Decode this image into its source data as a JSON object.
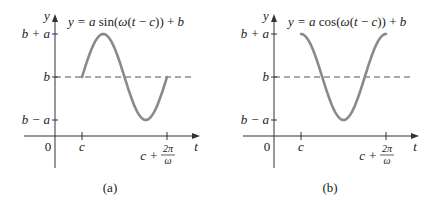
{
  "chart_data": [
    {
      "type": "line",
      "panel_label": "(a)",
      "function": "sin",
      "title": "y = a sin(ω(t − c)) + b",
      "title_parts": [
        "y = ",
        "a",
        " sin(",
        "ω",
        "(",
        "t",
        " − ",
        "c",
        ")) + ",
        "b"
      ],
      "xlabel": "t",
      "ylabel": "y",
      "origin_label": "0",
      "x_ticks": [
        {
          "label": "c",
          "value": 0
        },
        {
          "label_main": "c + ",
          "label_num": "2π",
          "label_den": "ω",
          "value": 1
        }
      ],
      "y_ticks": [
        {
          "label": "b + a",
          "value": 1
        },
        {
          "label": "b",
          "value": 0
        },
        {
          "label": "b − a",
          "value": -1
        }
      ],
      "dashed_line": {
        "y": 0,
        "label": "b"
      },
      "x_range_periods": [
        0,
        1
      ],
      "series": [
        {
          "name": "y",
          "amplitude": 1,
          "midline": 0,
          "periods": 1
        }
      ],
      "colors": {
        "curve": "#8a8a8a",
        "axis": "#333333"
      }
    },
    {
      "type": "line",
      "panel_label": "(b)",
      "function": "cos",
      "title": "y = a cos(ω(t − c)) + b",
      "title_parts": [
        "y = ",
        "a",
        " cos(",
        "ω",
        "(",
        "t",
        " − ",
        "c",
        ")) + ",
        "b"
      ],
      "xlabel": "t",
      "ylabel": "y",
      "origin_label": "0",
      "x_ticks": [
        {
          "label": "c",
          "value": 0
        },
        {
          "label_main": "c + ",
          "label_num": "2π",
          "label_den": "ω",
          "value": 1
        }
      ],
      "y_ticks": [
        {
          "label": "b + a",
          "value": 1
        },
        {
          "label": "b",
          "value": 0
        },
        {
          "label": "b − a",
          "value": -1
        }
      ],
      "dashed_line": {
        "y": 0,
        "label": "b"
      },
      "x_range_periods": [
        0,
        1
      ],
      "series": [
        {
          "name": "y",
          "amplitude": 1,
          "midline": 0,
          "periods": 1
        }
      ],
      "colors": {
        "curve": "#8a8a8a",
        "axis": "#333333"
      }
    }
  ]
}
